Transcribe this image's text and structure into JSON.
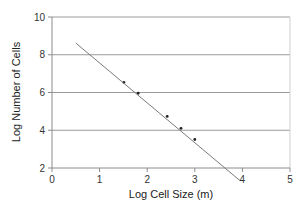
{
  "chart_data": {
    "type": "scatter",
    "title": "",
    "xlabel": "Log Cell Size (m)",
    "ylabel": "Log Number of Cells",
    "xlim": [
      0,
      5
    ],
    "ylim": [
      2,
      10
    ],
    "x_ticks": [
      "0",
      "1",
      "2",
      "3",
      "4",
      "5"
    ],
    "y_ticks": [
      "2",
      "4",
      "6",
      "8",
      "10"
    ],
    "grid": {
      "horizontal": true,
      "vertical": false
    },
    "legend": null,
    "series": [
      {
        "name": "data",
        "mode": "markers",
        "x": [
          1.51,
          1.81,
          2.42,
          2.71,
          3.0
        ],
        "y": [
          6.54,
          5.96,
          4.73,
          4.1,
          3.51
        ]
      },
      {
        "name": "fit",
        "mode": "line",
        "x": [
          0.5,
          3.95
        ],
        "y": [
          8.62,
          1.33
        ]
      }
    ],
    "colors": {
      "grid": "#9a9a9a",
      "axis": "#8c8c8c",
      "line": "#7a7a7a",
      "marker": "#222222"
    }
  }
}
